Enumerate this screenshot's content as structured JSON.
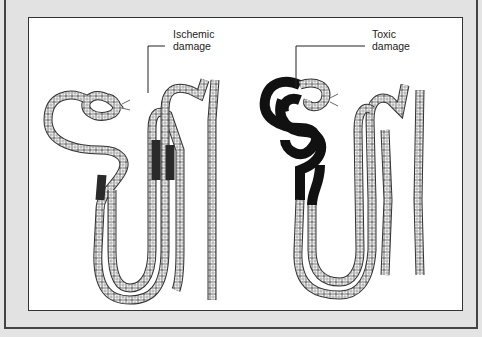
{
  "figure": {
    "labels": {
      "ischemic": [
        "Ischemic",
        "damage"
      ],
      "toxic": [
        "Toxic",
        "damage"
      ]
    },
    "colors": {
      "frame": "#e2e2e2",
      "panel": "#ffffff",
      "outline": "#333333",
      "damage_fill": "#111111",
      "ischemic_fill": "#3a3a3a"
    },
    "nephrons": [
      {
        "name": "ischemic-nephron",
        "damage_type": "Ischemic damage",
        "damaged_segments": "straight proximal tubule (pars recta) patches"
      },
      {
        "name": "toxic-nephron",
        "damage_type": "Toxic damage",
        "damaged_segments": "proximal convoluted tubule"
      }
    ]
  }
}
